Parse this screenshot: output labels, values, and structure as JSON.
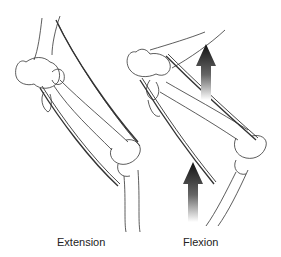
{
  "diagram": {
    "panels": [
      {
        "id": "extension",
        "label": "Extension"
      },
      {
        "id": "flexion",
        "label": "Flexion"
      }
    ],
    "arrows": [
      {
        "panel": "flexion",
        "direction": "up",
        "position": "upper"
      },
      {
        "panel": "flexion",
        "direction": "up",
        "position": "lower"
      }
    ],
    "colors": {
      "line": "#333333",
      "arrow_dark": "#1a1a1a",
      "arrow_light": "#ffffff",
      "background": "#ffffff"
    }
  }
}
